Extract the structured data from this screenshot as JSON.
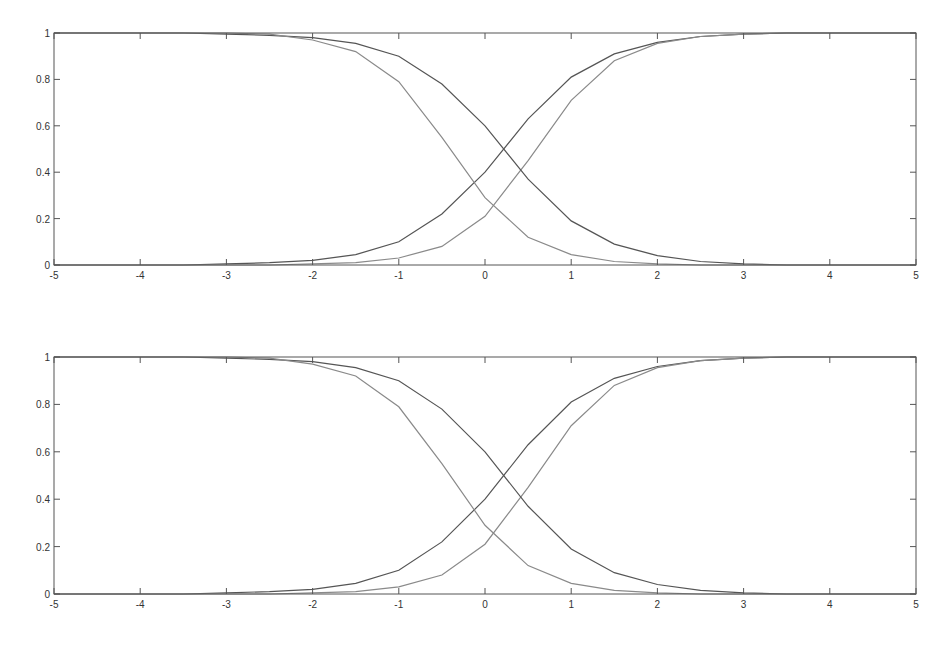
{
  "chart_data": [
    {
      "type": "line",
      "title": "",
      "xlabel": "",
      "ylabel": "",
      "xlim": [
        -5,
        5
      ],
      "ylim": [
        0,
        1
      ],
      "grid": false,
      "x_ticks": [
        "-5",
        "-4",
        "-3",
        "-2",
        "-1",
        "0",
        "1",
        "2",
        "3",
        "4",
        "5"
      ],
      "y_ticks": [
        "0",
        "0.2",
        "0.4",
        "0.6",
        "0.8",
        "1"
      ],
      "x": [
        -5,
        -4.5,
        -4,
        -3.5,
        -3,
        -2.5,
        -2,
        -1.5,
        -1,
        -0.5,
        0,
        0.5,
        1,
        1.5,
        2,
        2.5,
        3,
        3.5,
        4,
        4.5,
        5
      ],
      "series": [
        {
          "name": "rising-dark",
          "color": "#555555",
          "values": [
            0.0,
            0.0,
            0.0,
            0.0,
            0.005,
            0.01,
            0.02,
            0.045,
            0.1,
            0.22,
            0.4,
            0.63,
            0.81,
            0.91,
            0.96,
            0.985,
            0.995,
            1.0,
            1.0,
            1.0,
            1.0
          ]
        },
        {
          "name": "rising-light",
          "color": "#8a8a8a",
          "values": [
            0.0,
            0.0,
            0.0,
            0.0,
            0.0,
            0.0,
            0.005,
            0.01,
            0.03,
            0.08,
            0.21,
            0.45,
            0.71,
            0.88,
            0.955,
            0.985,
            0.995,
            1.0,
            1.0,
            1.0,
            1.0
          ]
        },
        {
          "name": "falling-dark",
          "color": "#555555",
          "values": [
            1.0,
            1.0,
            1.0,
            1.0,
            0.995,
            0.99,
            0.98,
            0.955,
            0.9,
            0.78,
            0.6,
            0.37,
            0.19,
            0.09,
            0.04,
            0.015,
            0.005,
            0.0,
            0.0,
            0.0,
            0.0
          ]
        },
        {
          "name": "falling-light",
          "color": "#8a8a8a",
          "values": [
            1.0,
            1.0,
            1.0,
            1.0,
            1.0,
            0.995,
            0.97,
            0.92,
            0.79,
            0.55,
            0.29,
            0.12,
            0.045,
            0.015,
            0.005,
            0.0,
            0.0,
            0.0,
            0.0,
            0.0,
            0.0
          ]
        }
      ]
    },
    {
      "type": "line",
      "title": "",
      "xlabel": "",
      "ylabel": "",
      "xlim": [
        -5,
        5
      ],
      "ylim": [
        0,
        1
      ],
      "grid": false,
      "x_ticks": [
        "-5",
        "-4",
        "-3",
        "-2",
        "-1",
        "0",
        "1",
        "2",
        "3",
        "4",
        "5"
      ],
      "y_ticks": [
        "0",
        "0.2",
        "0.4",
        "0.6",
        "0.8",
        "1"
      ],
      "x": [
        -5,
        -4.5,
        -4,
        -3.5,
        -3,
        -2.5,
        -2,
        -1.5,
        -1,
        -0.5,
        0,
        0.5,
        1,
        1.5,
        2,
        2.5,
        3,
        3.5,
        4,
        4.5,
        5
      ],
      "series": [
        {
          "name": "rising-dark",
          "color": "#555555",
          "values": [
            0.0,
            0.0,
            0.0,
            0.0,
            0.005,
            0.01,
            0.02,
            0.045,
            0.1,
            0.22,
            0.4,
            0.63,
            0.81,
            0.91,
            0.96,
            0.985,
            0.995,
            1.0,
            1.0,
            1.0,
            1.0
          ]
        },
        {
          "name": "rising-light",
          "color": "#8a8a8a",
          "values": [
            0.0,
            0.0,
            0.0,
            0.0,
            0.0,
            0.0,
            0.005,
            0.01,
            0.03,
            0.08,
            0.21,
            0.45,
            0.71,
            0.88,
            0.955,
            0.985,
            0.995,
            1.0,
            1.0,
            1.0,
            1.0
          ]
        },
        {
          "name": "falling-dark",
          "color": "#555555",
          "values": [
            1.0,
            1.0,
            1.0,
            1.0,
            0.995,
            0.99,
            0.98,
            0.955,
            0.9,
            0.78,
            0.6,
            0.37,
            0.19,
            0.09,
            0.04,
            0.015,
            0.005,
            0.0,
            0.0,
            0.0,
            0.0
          ]
        },
        {
          "name": "falling-light",
          "color": "#8a8a8a",
          "values": [
            1.0,
            1.0,
            1.0,
            1.0,
            1.0,
            0.995,
            0.97,
            0.92,
            0.79,
            0.55,
            0.29,
            0.12,
            0.045,
            0.015,
            0.005,
            0.0,
            0.0,
            0.0,
            0.0,
            0.0,
            0.0
          ]
        }
      ]
    }
  ]
}
